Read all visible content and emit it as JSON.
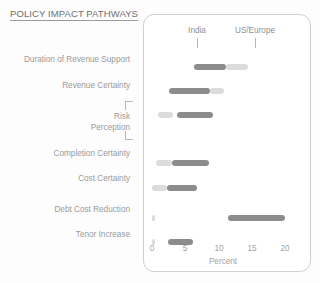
{
  "header": {
    "title": "POLICY IMPACT PATHWAYS"
  },
  "chart_data": {
    "type": "bar",
    "orientation": "horizontal",
    "title": "POLICY IMPACT PATHWAYS",
    "xlabel": "Percent",
    "ylabel": "",
    "xlim": [
      0,
      21
    ],
    "xticks": [
      0,
      5,
      10,
      15,
      20
    ],
    "xticklabels": [
      "0",
      "5",
      "10",
      "15",
      "20"
    ],
    "grid": false,
    "legend_position": "top",
    "legend": [
      {
        "name": "India",
        "color": "#8c8c8c"
      },
      {
        "name": "US/Europe",
        "color": "#dcdcdc"
      }
    ],
    "categories": [
      "Duration of Revenue Support",
      "Revenue Certainty",
      "Risk Perception",
      "Completion Certainty",
      "Cost Certainty",
      "Debt Cost Reduction",
      "Tenor Increase"
    ],
    "series": [
      {
        "name": "India",
        "color": "#8c8c8c",
        "segments": [
          {
            "category": "Duration of Revenue Support",
            "start": 6.3,
            "end": 11.2
          },
          {
            "category": "Revenue Certainty",
            "start": 2.6,
            "end": 8.7
          },
          {
            "category": "Risk Perception",
            "start": 3.8,
            "end": 9.2
          },
          {
            "category": "Completion Certainty",
            "start": 3.0,
            "end": 8.6
          },
          {
            "category": "Cost Certainty",
            "start": 2.3,
            "end": 6.8
          },
          {
            "category": "Debt Cost Reduction",
            "start": 11.4,
            "end": 20.0
          },
          {
            "category": "Tenor Increase",
            "start": 2.4,
            "end": 6.2
          }
        ]
      },
      {
        "name": "US/Europe",
        "color": "#dcdcdc",
        "segments": [
          {
            "category": "Duration of Revenue Support",
            "start": 11.2,
            "end": 14.4
          },
          {
            "category": "Revenue Certainty",
            "start": 8.7,
            "end": 10.8
          },
          {
            "category": "Risk Perception",
            "start": 0.9,
            "end": 3.2
          },
          {
            "category": "Completion Certainty",
            "start": 0.6,
            "end": 3.0
          },
          {
            "category": "Cost Certainty",
            "start": 0.0,
            "end": 2.3
          },
          {
            "category": "Debt Cost Reduction",
            "start": 0.0,
            "end": 0.3
          },
          {
            "category": "Tenor Increase",
            "start": 0.0,
            "end": 0.3
          }
        ]
      }
    ],
    "rows": [
      {
        "label": "Duration of Revenue Support",
        "india": [
          6.3,
          11.2
        ],
        "us_europe": [
          11.2,
          14.4
        ]
      },
      {
        "label": "Revenue Certainty",
        "india": [
          2.6,
          8.7
        ],
        "us_europe": [
          8.7,
          10.8
        ]
      },
      {
        "label": "Risk Perception",
        "india": [
          3.8,
          9.2
        ],
        "us_europe": [
          0.9,
          3.2
        ]
      },
      {
        "label": "Completion Certainty",
        "india": [
          3.0,
          8.6
        ],
        "us_europe": [
          0.6,
          3.0
        ]
      },
      {
        "label": "Cost Certainty",
        "india": [
          2.3,
          6.8
        ],
        "us_europe": [
          0.0,
          2.3
        ]
      },
      {
        "label": "Debt Cost Reduction",
        "india": [
          11.4,
          20.0
        ],
        "us_europe": [
          0.0,
          0.3
        ]
      },
      {
        "label": "Tenor Increase",
        "india": [
          2.4,
          6.2
        ],
        "us_europe": [
          0.0,
          0.3
        ]
      }
    ]
  },
  "row_labels": [
    {
      "id": "duration-of-revenue-support",
      "text": "Duration of Revenue Support"
    },
    {
      "id": "revenue-certainty",
      "text": "Revenue Certainty"
    },
    {
      "id": "risk-perception-line1",
      "text": "Risk"
    },
    {
      "id": "risk-perception-line2",
      "text": "Perception"
    },
    {
      "id": "completion-certainty",
      "text": "Completion Certainty"
    },
    {
      "id": "cost-certainty",
      "text": "Cost Certainty"
    },
    {
      "id": "debt-cost-reduction",
      "text": "Debt Cost Reduction"
    },
    {
      "id": "tenor-increase",
      "text": "Tenor Increase"
    }
  ],
  "axis": {
    "tick0": "0",
    "tick1": "5",
    "tick2": "10",
    "tick3": "15",
    "tick4": "20",
    "title": "Percent"
  },
  "legend": {
    "india": "India",
    "us_europe": "US/Europe"
  },
  "colors": {
    "india": "#8c8c8c",
    "us_europe": "#dcdcdc",
    "panel_border": "#cfcfcf",
    "text": "#9a9a9a",
    "title": "#6f6f6f"
  }
}
